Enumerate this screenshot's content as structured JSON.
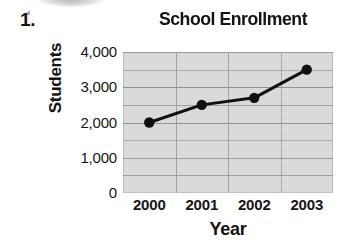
{
  "worksheet": {
    "question_number": "1."
  },
  "chart_data": {
    "type": "line",
    "title": "School Enrollment",
    "xlabel": "Year",
    "ylabel": "Students",
    "categories": [
      "2000",
      "2001",
      "2002",
      "2003"
    ],
    "values": [
      2000,
      2500,
      2700,
      3500
    ],
    "series": [
      {
        "name": "School Enrollment",
        "values": [
          2000,
          2500,
          2700,
          3500
        ]
      }
    ],
    "ylim": [
      0,
      4000
    ],
    "ytick_labels": [
      "4,000",
      "3,000",
      "2,000",
      "1,000",
      "0"
    ],
    "ytick_values": [
      4000,
      3000,
      2000,
      1000,
      0
    ],
    "ygrid_step": 500,
    "grid": true,
    "legend": "none",
    "marker": "filled-circle",
    "line_color": "#111111",
    "plot_background": "#d5d5d5",
    "gridline_color": "#8f8f8f"
  }
}
